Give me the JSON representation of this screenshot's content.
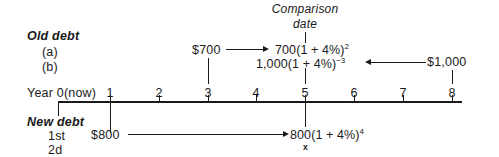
{
  "diagram": {
    "title_old": "Old debt",
    "row_a": "(a)",
    "row_b": "(b)",
    "title_new": "New debt",
    "row_1st": "1st",
    "row_2d": "2d",
    "comparison_line1": "Comparison",
    "comparison_line2": "date",
    "year_axis_label": "Year 0(now)",
    "x_marker": "x",
    "amount_700": "$700",
    "amount_1000": "$1,000",
    "amount_800": "$800",
    "formula_a_base": "700(1 + 4%)",
    "formula_a_exp": "2",
    "formula_b_base": "1,000(1 + 4%)",
    "formula_b_exp": "−3",
    "formula_new_base": "800(1 + 4%)",
    "formula_new_exp": "4",
    "ticks": [
      {
        "label": "1",
        "x": 110
      },
      {
        "label": "2",
        "x": 159
      },
      {
        "label": "3",
        "x": 208
      },
      {
        "label": "4",
        "x": 256
      },
      {
        "label": "5",
        "x": 305
      },
      {
        "label": "6",
        "x": 354
      },
      {
        "label": "7",
        "x": 403
      },
      {
        "label": "8",
        "x": 452
      }
    ],
    "colors": {
      "ink": "#1a1a1a",
      "background": "#ffffff"
    }
  }
}
